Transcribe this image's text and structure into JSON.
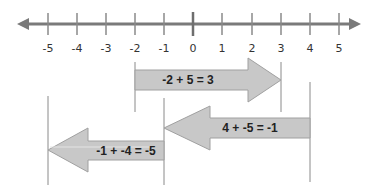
{
  "number_line": {
    "min": -5,
    "max": 5,
    "ticks": [
      "-5",
      "-4",
      "-3",
      "-2",
      "-1",
      "0",
      "1",
      "2",
      "3",
      "4",
      "5"
    ],
    "line_color": "#7a7a7a"
  },
  "arrows": [
    {
      "equation": "-2 + 5 = 3",
      "start": -2,
      "end": 3,
      "direction": "right"
    },
    {
      "equation": "4 + -5 =  -1",
      "start": 4,
      "end": -1,
      "direction": "left"
    },
    {
      "equation": "-1 + -4 = -5",
      "start": -1,
      "end": -5,
      "direction": "left"
    }
  ],
  "colors": {
    "arrow_fill": "#c8c8c8",
    "arrow_stroke": "#9a9a9a",
    "guide_line": "#8a8a8a"
  }
}
